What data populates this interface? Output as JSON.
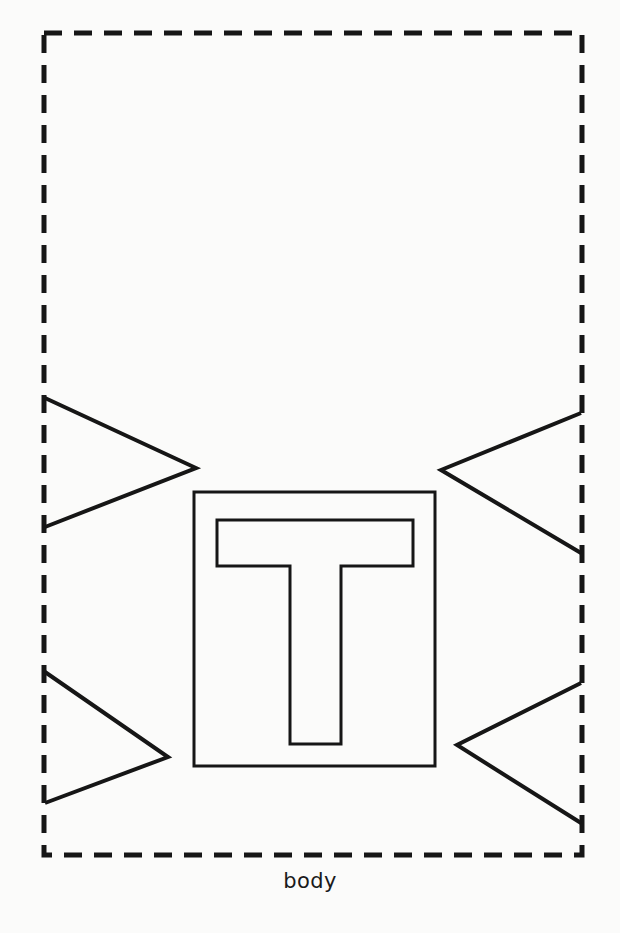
{
  "figure": {
    "caption": "body",
    "caption_position": "below-boundary-center",
    "background_color": "#fbfbfa",
    "stroke_color": "#161616",
    "canvas": {
      "width": 620,
      "height": 933
    },
    "boundary": {
      "name": "body-boundary",
      "style": "dashed",
      "shape": "rectangle",
      "x": 44,
      "y": 33,
      "width": 538,
      "height": 822,
      "stroke_width": 5,
      "dash_length": 18,
      "gap_length": 12
    },
    "center_box": {
      "name": "center-rectangle",
      "style": "solid",
      "x": 194,
      "y": 492,
      "width": 241,
      "height": 274,
      "stroke_width": 3
    },
    "letter_outline": {
      "name": "letter-t-outline",
      "glyph": "T",
      "style": "solid-outline",
      "stroke_width": 3,
      "crossbar": {
        "left": 217,
        "right": 413,
        "top": 520,
        "bottom": 566
      },
      "stem": {
        "left": 290,
        "right": 341,
        "bottom": 744
      }
    },
    "triangles": [
      {
        "name": "triangle-upper-left",
        "side": "left",
        "direction": "points-right",
        "stroke_width": 4,
        "points": "45,398 196,468 45,527"
      },
      {
        "name": "triangle-lower-left",
        "side": "left",
        "direction": "points-right",
        "stroke_width": 4,
        "points": "45,672 168,757 45,803"
      },
      {
        "name": "triangle-upper-right",
        "side": "right",
        "direction": "points-left",
        "stroke_width": 4,
        "points": "581,413 441,470 581,553"
      },
      {
        "name": "triangle-lower-right",
        "side": "right",
        "direction": "points-left",
        "stroke_width": 4,
        "points": "581,683 457,745 581,823"
      }
    ]
  }
}
